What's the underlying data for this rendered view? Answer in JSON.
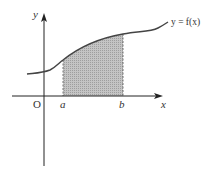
{
  "diagram": {
    "type": "definite-integral-area",
    "curve_label": "y = f(x)",
    "axis_labels": {
      "x": "x",
      "y": "y",
      "origin": "O"
    },
    "bounds": {
      "lower": "a",
      "upper": "b"
    },
    "colors": {
      "axis": "#222222",
      "curve": "#444444",
      "shade": "#bdbdbd",
      "bound_line": "#555555"
    }
  }
}
